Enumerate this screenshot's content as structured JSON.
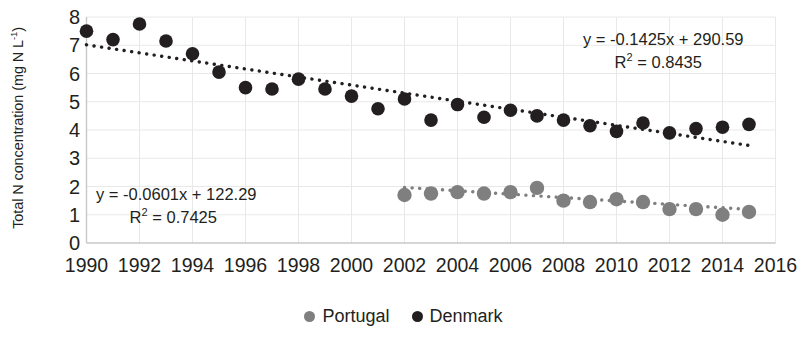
{
  "chart_data": {
    "type": "scatter",
    "title": "",
    "xlabel": "",
    "ylabel": "Total N concentration (mg N L-1)",
    "ylabel_html": "Total N concentration (mg N L<sup>-1</sup>)",
    "xlim": [
      1990,
      2016
    ],
    "ylim": [
      0,
      8
    ],
    "xticks": [
      1990,
      1992,
      1994,
      1996,
      1998,
      2000,
      2002,
      2004,
      2006,
      2008,
      2010,
      2012,
      2014,
      2016
    ],
    "yticks": [
      0,
      1,
      2,
      3,
      4,
      5,
      6,
      7,
      8
    ],
    "grid": "both-faint",
    "legend_position": "bottom-center",
    "series": [
      {
        "name": "Portugal",
        "color": "#7f7f7f",
        "marker": "circle",
        "x": [
          2002,
          2003,
          2004,
          2005,
          2006,
          2007,
          2008,
          2009,
          2010,
          2011,
          2012,
          2013,
          2014,
          2015
        ],
        "values": [
          1.7,
          1.75,
          1.8,
          1.75,
          1.8,
          1.95,
          1.5,
          1.45,
          1.55,
          1.45,
          1.2,
          1.2,
          1.0,
          1.1
        ],
        "trendline": {
          "equation": "y = -0.0601x + 122.29",
          "r2_label": "R2 = 0.7425",
          "slope": -0.0601,
          "intercept": 122.29,
          "r2": 0.7425,
          "style": "dotted",
          "color": "#7f7f7f"
        }
      },
      {
        "name": "Denmark",
        "color": "#231f20",
        "marker": "circle",
        "x": [
          1990,
          1991,
          1992,
          1993,
          1994,
          1995,
          1996,
          1997,
          1998,
          1999,
          2000,
          2001,
          2002,
          2003,
          2004,
          2005,
          2006,
          2007,
          2008,
          2009,
          2010,
          2011,
          2012,
          2013,
          2014,
          2015
        ],
        "values": [
          7.5,
          7.2,
          7.75,
          7.15,
          6.7,
          6.05,
          5.5,
          5.45,
          5.8,
          5.45,
          5.2,
          4.75,
          5.1,
          4.35,
          4.9,
          4.45,
          4.7,
          4.5,
          4.35,
          4.15,
          3.95,
          4.25,
          3.9,
          4.05,
          4.1,
          4.2
        ],
        "trendline": {
          "equation": "y = -0.1425x + 290.59",
          "r2_label": "R2 = 0.8435",
          "slope": -0.1425,
          "intercept": 290.59,
          "r2": 0.8435,
          "style": "dotted",
          "color": "#231f20"
        }
      }
    ]
  },
  "annotations": {
    "portugal_eq": "y = -0.0601x + 122.29",
    "portugal_r2_prefix": "R",
    "portugal_r2_sup": "2",
    "portugal_r2_value": " = 0.7425",
    "denmark_eq": "y = -0.1425x + 290.59",
    "denmark_r2_prefix": "R",
    "denmark_r2_sup": "2",
    "denmark_r2_value": " = 0.8435"
  },
  "legend": {
    "items": [
      {
        "label": "Portugal",
        "color": "#7f7f7f"
      },
      {
        "label": "Denmark",
        "color": "#231f20"
      }
    ]
  },
  "axis_title": {
    "y_prefix": "Total N concentration (mg N L",
    "y_sup": "-1",
    "y_suffix": ")"
  },
  "colors": {
    "portugal": "#7f7f7f",
    "denmark": "#231f20",
    "grid": "#e8e8e8",
    "axis": "#c8c8c8",
    "background": "#ffffff"
  }
}
